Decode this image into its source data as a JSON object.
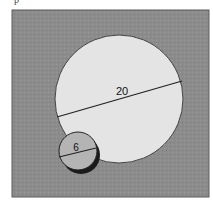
{
  "figure": {
    "cut_text": "p",
    "background_color": "#8a8a8a",
    "large_circle": {
      "label": "20",
      "fill": "#e4e4e4",
      "stroke": "#333333"
    },
    "small_circle": {
      "label": "6",
      "fill": "#b4b4b4",
      "stroke": "#222222"
    }
  }
}
